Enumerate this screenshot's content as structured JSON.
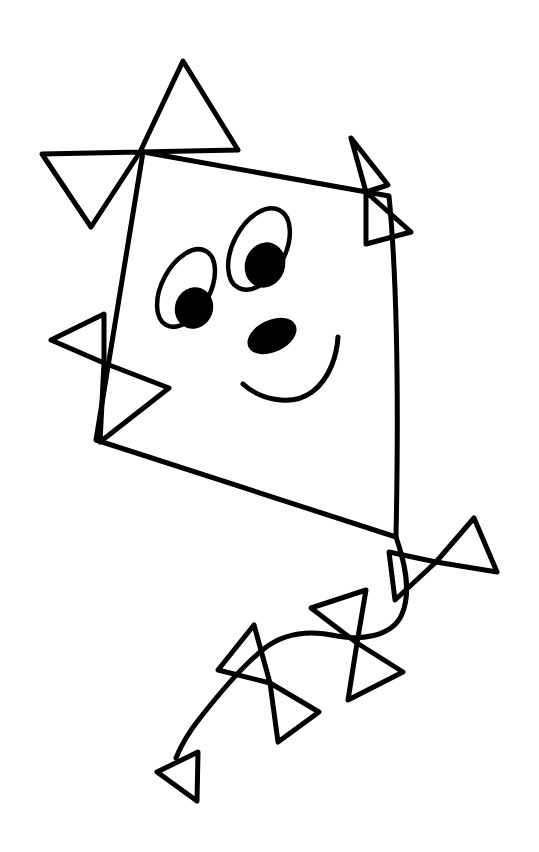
{
  "artwork": {
    "title": "Kite with smiling face and bow tail",
    "style": "coloring-book line art",
    "canvas": {
      "width": 539,
      "height": 852
    },
    "colors": {
      "background": "#ffffff",
      "ink": "#000000"
    },
    "stroke": {
      "body_width": 5,
      "bow_width": 5,
      "tail_string_width": 5,
      "eye_outline_width": 4.5,
      "mouth_width": 5
    },
    "parts": {
      "kite_body": {
        "label": "kite body",
        "apex_top": [
          143,
          152
        ],
        "apex_right": [
          390,
          196
        ],
        "apex_bottom": [
          396,
          537
        ],
        "apex_left": [
          96,
          440
        ],
        "path": "M143,152 L389,196 C399,300 398,440 396,537 L96,440 Z"
      },
      "face": {
        "label": "smiling face",
        "eye_right": {
          "label": "right eye",
          "outline_cx": 259,
          "outline_cy": 249,
          "outline_rx": 26,
          "outline_ry": 44,
          "outline_rotate": 28,
          "pupil_cx": 265,
          "pupil_cy": 265,
          "pupil_rx": 20,
          "pupil_ry": 23,
          "pupil_rotate": 20
        },
        "eye_left": {
          "label": "left eye",
          "outline_cx": 186,
          "outline_cy": 288,
          "outline_rx": 24,
          "outline_ry": 42,
          "outline_rotate": 28,
          "pupil_cx": 194,
          "pupil_cy": 308,
          "pupil_rx": 19,
          "pupil_ry": 21,
          "pupil_rotate": 20
        },
        "nose": {
          "label": "nose",
          "cx": 272,
          "cy": 336,
          "rx": 26,
          "ry": 16,
          "rotate": -25
        },
        "mouth": {
          "label": "smile",
          "path": "M243,384 C258,398 290,408 312,392 C331,378 337,353 338,337"
        }
      },
      "bows_on_body": [
        {
          "label": "top-left bow",
          "center": [
            140,
            152
          ],
          "path": "M140,152 L183,61 L238,150 Z M140,152 L42,154 L91,227 Z"
        },
        {
          "label": "right bow",
          "center": [
            366,
            192
          ],
          "path": "M366,192 L351,138 L388,185 Z M366,192 L411,232 L366,244 Z"
        },
        {
          "label": "left bow",
          "center": [
            104,
            363
          ],
          "path": "M104,363 L51,340 L104,314 Z M104,363 L169,388 L100,442 Z"
        }
      ],
      "tail": {
        "label": "kite tail",
        "string_path": "M396,537 C404,560 412,590 402,614 C392,638 358,640 337,636 C310,630 286,632 265,648 C244,664 222,690 200,718 C188,733 180,748 176,758",
        "bows": [
          {
            "label": "tail bow 1",
            "center": [
              436,
              562
            ],
            "path": "M436,562 L389,552 L395,600 Z M436,562 L474,518 L497,572 Z"
          },
          {
            "label": "tail bow 2",
            "center": [
              357,
              643
            ],
            "path": "M357,643 L311,608 L366,590 Z M357,643 L403,672 L348,700 Z"
          },
          {
            "label": "tail bow 3",
            "center": [
              270,
              683
            ],
            "path": "M270,683 L218,670 L254,625 Z M270,683 L319,712 L278,742 Z"
          },
          {
            "label": "tail end triangle",
            "center": [
              198,
              752
            ],
            "path": "M198,752 L157,772 L197,801 Z"
          }
        ]
      }
    }
  }
}
